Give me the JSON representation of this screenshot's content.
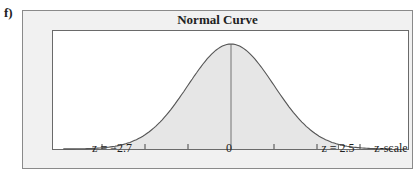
{
  "part_label": "f)",
  "chart_data": {
    "type": "area",
    "title": "Normal Curve",
    "xlabel": "z-scale",
    "ylabel": "",
    "distribution": "standard normal",
    "mean": 0,
    "sd": 1,
    "xlim": [
      -4.2,
      4.1
    ],
    "ticks": [
      -3,
      -2,
      -1,
      0,
      1,
      2,
      3
    ],
    "shaded_region": {
      "from": -2.7,
      "to": 2.5
    },
    "annotations": [
      {
        "x": -2.7,
        "label": "z = −2.7"
      },
      {
        "x": 0,
        "label": "0"
      },
      {
        "x": 2.5,
        "label": "z = 2.5"
      }
    ],
    "grid": false,
    "legend": null
  },
  "labels": {
    "left": "z = −2.7",
    "center": "0",
    "right": "z = 2.5",
    "axis": "z-scale"
  },
  "colors": {
    "shade": "#e6e6e6",
    "frame": "#f1f1f1",
    "line": "#555555"
  }
}
